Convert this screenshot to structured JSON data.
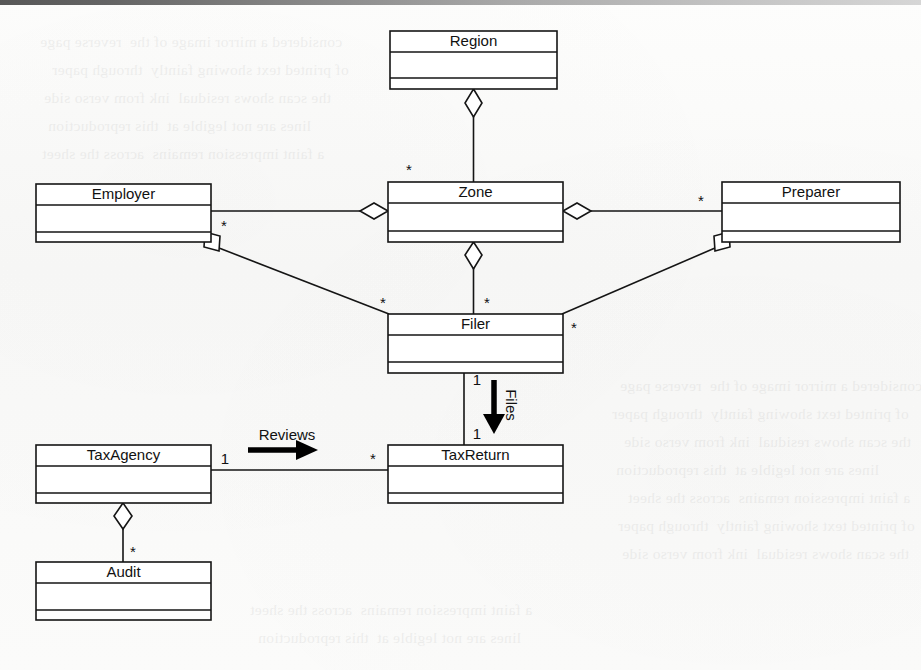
{
  "page": {
    "kind": "uml-class-diagram",
    "width": 921,
    "height": 670,
    "background_color": "#fbfbfa",
    "line_color": "#151515",
    "text_color": "#111111"
  },
  "classes": [
    {
      "id": "region",
      "name": "Region",
      "x": 390,
      "y": 31,
      "w": 167,
      "h": 58
    },
    {
      "id": "employer",
      "name": "Employer",
      "x": 36,
      "y": 184,
      "w": 175,
      "h": 58
    },
    {
      "id": "zone",
      "name": "Zone",
      "x": 388,
      "y": 182,
      "w": 175,
      "h": 60
    },
    {
      "id": "preparer",
      "name": "Preparer",
      "x": 722,
      "y": 182,
      "w": 178,
      "h": 60
    },
    {
      "id": "filer",
      "name": "Filer",
      "x": 388,
      "y": 314,
      "w": 175,
      "h": 59
    },
    {
      "id": "taxagency",
      "name": "TaxAgency",
      "x": 36,
      "y": 445,
      "w": 175,
      "h": 58
    },
    {
      "id": "taxreturn",
      "name": "TaxReturn",
      "x": 388,
      "y": 445,
      "w": 175,
      "h": 58
    },
    {
      "id": "audit",
      "name": "Audit",
      "x": 36,
      "y": 562,
      "w": 175,
      "h": 58
    }
  ],
  "relationships": [
    {
      "id": "region-zone",
      "kind": "aggregation",
      "whole": "Region",
      "part": "Zone",
      "whole_end_marker": "diamond",
      "part_multiplicity": "*"
    },
    {
      "id": "zone-employer",
      "kind": "aggregation",
      "whole": "Zone",
      "part": "Employer",
      "whole_end_marker": "diamond",
      "part_multiplicity": ""
    },
    {
      "id": "zone-preparer",
      "kind": "aggregation",
      "whole": "Zone",
      "part": "Preparer",
      "whole_end_marker": "diamond",
      "part_multiplicity": "*"
    },
    {
      "id": "zone-filer",
      "kind": "aggregation",
      "whole": "Zone",
      "part": "Filer",
      "whole_end_marker": "diamond",
      "part_multiplicity": "*"
    },
    {
      "id": "employer-filer",
      "kind": "aggregation",
      "whole": "Employer",
      "part": "Filer",
      "whole_end_marker": "diamond",
      "whole_multiplicity": "*",
      "part_multiplicity": "*"
    },
    {
      "id": "preparer-filer",
      "kind": "aggregation",
      "whole": "Preparer",
      "part": "Filer",
      "whole_end_marker": "diamond",
      "whole_multiplicity": "*",
      "part_multiplicity": "*"
    },
    {
      "id": "filer-taxreturn",
      "kind": "association",
      "source": "Filer",
      "target": "TaxReturn",
      "label": "Files",
      "label_orientation": "vertical",
      "direction_arrow": "down",
      "source_multiplicity": "1",
      "target_multiplicity": "1"
    },
    {
      "id": "taxagency-taxreturn",
      "kind": "association",
      "source": "TaxAgency",
      "target": "TaxReturn",
      "label": "Reviews",
      "label_orientation": "horizontal",
      "direction_arrow": "right",
      "source_multiplicity": "1",
      "target_multiplicity": "*"
    },
    {
      "id": "taxagency-audit",
      "kind": "aggregation",
      "whole": "TaxAgency",
      "part": "Audit",
      "whole_end_marker": "diamond",
      "part_multiplicity": "*"
    }
  ],
  "multiplicity_markers": [
    {
      "id": "m-zone-top",
      "text": "*",
      "x": 409,
      "y": 169
    },
    {
      "id": "m-preparer-left",
      "text": "*",
      "x": 709,
      "y": 200
    },
    {
      "id": "m-employer-corner",
      "text": "*",
      "x": 224,
      "y": 232
    },
    {
      "id": "m-filer-topleft",
      "text": "*",
      "x": 383,
      "y": 303
    },
    {
      "id": "m-filer-topmid",
      "text": "*",
      "x": 487,
      "y": 303
    },
    {
      "id": "m-filer-right",
      "text": "*",
      "x": 572,
      "y": 326
    },
    {
      "id": "m-preparer-corner",
      "text": "*",
      "x": 712,
      "y": 232
    },
    {
      "id": "m-filer-files-top",
      "text": "1",
      "x": 477,
      "y": 380
    },
    {
      "id": "m-filer-files-bot",
      "text": "1",
      "x": 477,
      "y": 434
    },
    {
      "id": "m-taxagency-right",
      "text": "1",
      "x": 225,
      "y": 459
    },
    {
      "id": "m-taxreturn-left",
      "text": "*",
      "x": 375,
      "y": 459
    },
    {
      "id": "m-audit-top",
      "text": "*",
      "x": 133,
      "y": 551
    }
  ],
  "association_labels": [
    {
      "id": "label-files",
      "text": "Files",
      "x": 503,
      "y": 405,
      "rotated": true
    },
    {
      "id": "label-reviews",
      "text": "Reviews",
      "x": 287,
      "y": 436,
      "rotated": false
    }
  ],
  "ghost_text": {
    "note": "faint bleed-through from the reverse side of the scanned page; illegible",
    "lines": [
      "considered a mirror image of the  reverse page",
      "of printed text showing faintly  through paper",
      "the scan shows residual  ink from verso side",
      "lines are not legible at  this reproduction",
      "a faint impression remains  across the sheet"
    ]
  }
}
